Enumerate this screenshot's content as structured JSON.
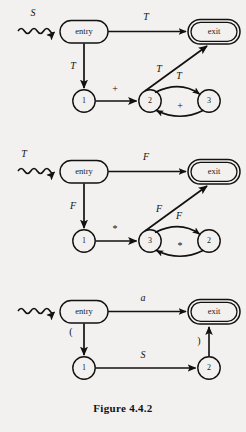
{
  "figure": {
    "caption": "Figure 4.4.2",
    "background_color": "#f2f1ef",
    "ink_color": "#111111"
  },
  "diagrams": [
    {
      "id": "diagram-1",
      "start_label": "S",
      "nodes": [
        {
          "id": "entry",
          "label": "entry",
          "shape": "rounded-rect"
        },
        {
          "id": "exit",
          "label": "exit",
          "shape": "double-rounded-rect"
        },
        {
          "id": "n1",
          "label": "1",
          "shape": "circle"
        },
        {
          "id": "n2",
          "label": "2",
          "shape": "circle"
        },
        {
          "id": "n3",
          "label": "3",
          "shape": "circle"
        }
      ],
      "edges": [
        {
          "from": "start",
          "to": "entry",
          "label": "S",
          "style": "wavy"
        },
        {
          "from": "entry",
          "to": "exit",
          "label": "T",
          "style": "straight"
        },
        {
          "from": "entry",
          "to": "n1",
          "label": "T",
          "style": "straight"
        },
        {
          "from": "n1",
          "to": "n2",
          "label": "+",
          "style": "straight"
        },
        {
          "from": "n2",
          "to": "exit",
          "label": "T",
          "style": "straight"
        },
        {
          "from": "n2",
          "to": "n3",
          "label": "T",
          "style": "curve-up"
        },
        {
          "from": "n3",
          "to": "n2",
          "label": "+",
          "style": "curve-down"
        }
      ]
    },
    {
      "id": "diagram-2",
      "start_label": "T",
      "nodes": [
        {
          "id": "entry",
          "label": "entry",
          "shape": "rounded-rect"
        },
        {
          "id": "exit",
          "label": "exit",
          "shape": "double-rounded-rect"
        },
        {
          "id": "n1",
          "label": "1",
          "shape": "circle"
        },
        {
          "id": "n3",
          "label": "3",
          "shape": "circle"
        },
        {
          "id": "n2",
          "label": "2",
          "shape": "circle"
        }
      ],
      "edges": [
        {
          "from": "start",
          "to": "entry",
          "label": "T",
          "style": "wavy"
        },
        {
          "from": "entry",
          "to": "exit",
          "label": "F",
          "style": "straight"
        },
        {
          "from": "entry",
          "to": "n1",
          "label": "F",
          "style": "straight"
        },
        {
          "from": "n1",
          "to": "n3",
          "label": "*",
          "style": "straight"
        },
        {
          "from": "n3",
          "to": "exit",
          "label": "F",
          "style": "straight"
        },
        {
          "from": "n3",
          "to": "n2",
          "label": "F",
          "style": "curve-up"
        },
        {
          "from": "n2",
          "to": "n3",
          "label": "*",
          "style": "curve-down"
        }
      ]
    },
    {
      "id": "diagram-3",
      "start_label": "",
      "nodes": [
        {
          "id": "entry",
          "label": "entry",
          "shape": "rounded-rect"
        },
        {
          "id": "exit",
          "label": "exit",
          "shape": "double-rounded-rect"
        },
        {
          "id": "n1",
          "label": "1",
          "shape": "circle"
        },
        {
          "id": "n2",
          "label": "2",
          "shape": "circle"
        }
      ],
      "edges": [
        {
          "from": "start",
          "to": "entry",
          "label": "",
          "style": "wavy"
        },
        {
          "from": "entry",
          "to": "exit",
          "label": "a",
          "style": "straight"
        },
        {
          "from": "entry",
          "to": "n1",
          "label": "(",
          "style": "straight"
        },
        {
          "from": "n1",
          "to": "n2",
          "label": "S",
          "style": "straight"
        },
        {
          "from": "n2",
          "to": "exit",
          "label": ")",
          "style": "straight"
        }
      ]
    }
  ]
}
